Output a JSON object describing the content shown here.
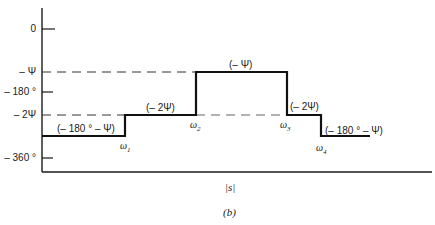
{
  "figure": {
    "caption": "(b)",
    "x_axis_label": "|s|",
    "y_ticks": [
      {
        "label": "0",
        "y": 29
      },
      {
        "label": "– Ψ",
        "y": 72
      },
      {
        "label": "– 180 °",
        "y": 92
      },
      {
        "label": "– 2Ψ",
        "y": 115
      },
      {
        "label": "– 360 °",
        "y": 158
      }
    ],
    "breakpoints": [
      {
        "label": "ω",
        "sub": "1",
        "x": 125
      },
      {
        "label": "ω",
        "sub": "2",
        "x": 196
      },
      {
        "label": "ω",
        "sub": "3",
        "x": 287
      },
      {
        "label": "ω",
        "sub": "4",
        "x": 321
      }
    ],
    "segment_labels": [
      {
        "text": "(– 180 ° – Ψ)"
      },
      {
        "text": "(– 2Ψ)"
      },
      {
        "text": "(– Ψ)"
      },
      {
        "text": "(– 2Ψ)"
      },
      {
        "text": "(– 180 ° – Ψ)"
      }
    ],
    "colors": {
      "line": "#1a1a1a",
      "dash": "#333333",
      "background": "#ffffff"
    }
  }
}
